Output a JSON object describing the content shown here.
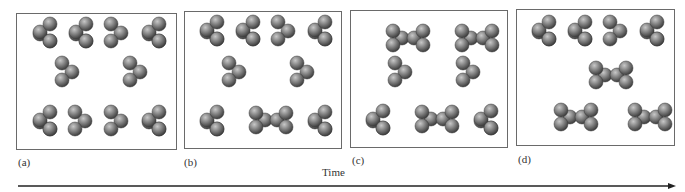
{
  "figure": {
    "time_axis_label": "Time",
    "panels": [
      {
        "id": "a",
        "label": "(a)",
        "box": {
          "x": 16,
          "y": 13,
          "w": 161,
          "h": 137
        },
        "molecules": [
          {
            "type": "L",
            "x": 26,
            "y": 18
          },
          {
            "type": "L",
            "x": 62,
            "y": 18
          },
          {
            "type": "R",
            "x": 98,
            "y": 18
          },
          {
            "type": "L",
            "x": 135,
            "y": 18
          },
          {
            "type": "R",
            "x": 49,
            "y": 57
          },
          {
            "type": "R",
            "x": 117,
            "y": 57
          },
          {
            "type": "L",
            "x": 26,
            "y": 106
          },
          {
            "type": "R",
            "x": 62,
            "y": 106
          },
          {
            "type": "R",
            "x": 98,
            "y": 106
          },
          {
            "type": "L",
            "x": 135,
            "y": 106
          }
        ]
      },
      {
        "id": "b",
        "label": "(b)",
        "box": {
          "x": 184,
          "y": 11,
          "w": 158,
          "h": 138
        },
        "molecules": [
          {
            "type": "L",
            "x": 25,
            "y": 18
          },
          {
            "type": "L",
            "x": 61,
            "y": 18
          },
          {
            "type": "R",
            "x": 97,
            "y": 18
          },
          {
            "type": "L",
            "x": 133,
            "y": 18
          },
          {
            "type": "R",
            "x": 48,
            "y": 59
          },
          {
            "type": "R",
            "x": 116,
            "y": 59
          },
          {
            "type": "L",
            "x": 25,
            "y": 108
          },
          {
            "type": "D",
            "x": 71,
            "y": 108
          },
          {
            "type": "L",
            "x": 133,
            "y": 108
          }
        ]
      },
      {
        "id": "c",
        "label": "(c)",
        "box": {
          "x": 350,
          "y": 10,
          "w": 158,
          "h": 138
        },
        "molecules": [
          {
            "type": "D",
            "x": 42,
            "y": 27
          },
          {
            "type": "D",
            "x": 111,
            "y": 27
          },
          {
            "type": "R",
            "x": 48,
            "y": 60
          },
          {
            "type": "R",
            "x": 116,
            "y": 60
          },
          {
            "type": "L",
            "x": 25,
            "y": 108
          },
          {
            "type": "D",
            "x": 71,
            "y": 108
          },
          {
            "type": "L",
            "x": 133,
            "y": 108
          }
        ]
      },
      {
        "id": "d",
        "label": "(d)",
        "box": {
          "x": 516,
          "y": 9,
          "w": 159,
          "h": 137
        },
        "molecules": [
          {
            "type": "L",
            "x": 25,
            "y": 20
          },
          {
            "type": "L",
            "x": 61,
            "y": 20
          },
          {
            "type": "R",
            "x": 97,
            "y": 20
          },
          {
            "type": "L",
            "x": 133,
            "y": 20
          },
          {
            "type": "D",
            "x": 79,
            "y": 65
          },
          {
            "type": "D",
            "x": 44,
            "y": 107
          },
          {
            "type": "D",
            "x": 118,
            "y": 107
          }
        ]
      }
    ],
    "legend": {
      "L": "tetrahedral molecule, single sphere on left",
      "R": "tetrahedral molecule, single sphere on right",
      "D": "dimer (two molecules joined)"
    },
    "colors": {
      "sphere_light": "#c8c8c8",
      "sphere_mid": "#7a7a7a",
      "sphere_dark": "#3a3a3a",
      "frame": "#6a6a6a",
      "axis": "#222222"
    }
  }
}
